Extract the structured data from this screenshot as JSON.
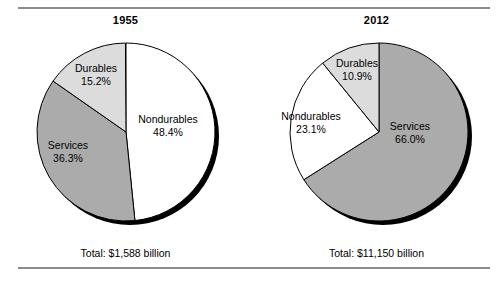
{
  "figure": {
    "background": "#ffffff",
    "rule_color": "#8c8c8c",
    "shadow_color": "#000000"
  },
  "colors": {
    "nondurables": "#ffffff",
    "services": "#ababab",
    "durables": "#dcdcdc",
    "outline": "#000000",
    "text": "#000000"
  },
  "panels": [
    {
      "title": "1955",
      "total": "Total: $1,588 billion",
      "slices": [
        {
          "label": "Nondurables",
          "pct_label": "48.4%",
          "value": 48.4,
          "fill": "#ffffff"
        },
        {
          "label": "Services",
          "pct_label": "36.3%",
          "value": 36.3,
          "fill": "#ababab"
        },
        {
          "label": "Durables",
          "pct_label": "15.2%",
          "value": 15.2,
          "fill": "#dcdcdc"
        }
      ]
    },
    {
      "title": "2012",
      "total": "Total: $11,150 billion",
      "slices": [
        {
          "label": "Services",
          "pct_label": "66.0%",
          "value": 66.0,
          "fill": "#ababab"
        },
        {
          "label": "Nondurables",
          "pct_label": "23.1%",
          "value": 23.1,
          "fill": "#ffffff"
        },
        {
          "label": "Durables",
          "pct_label": "10.9%",
          "value": 10.9,
          "fill": "#dcdcdc"
        }
      ]
    }
  ],
  "chart_data": {
    "type": "pie",
    "title": "",
    "legend_position": "none",
    "grid": false,
    "charts": [
      {
        "title": "1955",
        "total_label": "Total: $1,588 billion",
        "total_value": 1588,
        "total_units": "billion dollars",
        "categories": [
          "Nondurables",
          "Services",
          "Durables"
        ],
        "values": [
          48.4,
          36.3,
          15.2
        ],
        "value_units": "percent",
        "start_angle_deg": 0,
        "direction": "clockwise"
      },
      {
        "title": "2012",
        "total_label": "Total: $11,150 billion",
        "total_value": 11150,
        "total_units": "billion dollars",
        "categories": [
          "Services",
          "Nondurables",
          "Durables"
        ],
        "values": [
          66.0,
          23.1,
          10.9
        ],
        "value_units": "percent",
        "start_angle_deg": 0,
        "direction": "clockwise"
      }
    ]
  }
}
